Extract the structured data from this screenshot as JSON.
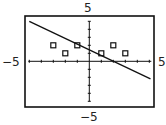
{
  "chart_data": {
    "type": "scatter",
    "title": "",
    "xlabel": "",
    "ylabel": "",
    "xlim": [
      -5,
      5
    ],
    "ylim": [
      -5,
      5
    ],
    "xtick_step": 1,
    "ytick_step": 1,
    "grid": false,
    "axis_labels": {
      "ymax": "5",
      "ymin": "-5",
      "xmin": "-5",
      "xmax": "5"
    },
    "series": [
      {
        "name": "data points",
        "type": "scatter",
        "marker": "square",
        "points": [
          [
            -3,
            2
          ],
          [
            -2,
            1
          ],
          [
            -1,
            2
          ],
          [
            1,
            1
          ],
          [
            2,
            2
          ],
          [
            3,
            1
          ]
        ]
      },
      {
        "name": "regression line",
        "type": "line",
        "slope": -0.7,
        "intercept": 1.5,
        "points": [
          [
            -5,
            5
          ],
          [
            5.1,
            -2.2
          ]
        ]
      }
    ]
  },
  "labels": {
    "top": "5",
    "bottom": "−5",
    "left": "−5",
    "right": "5"
  },
  "colors": {
    "ink": "#111111",
    "background": "#ffffff"
  }
}
